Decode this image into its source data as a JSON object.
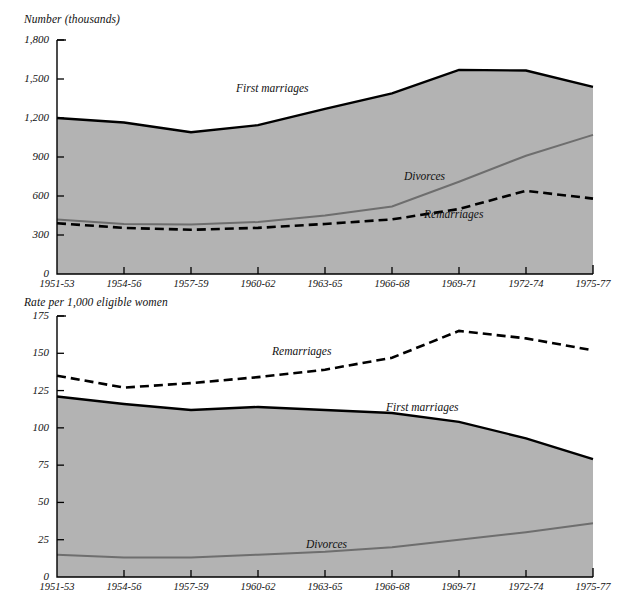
{
  "chart_data": [
    {
      "type": "area",
      "id": "marriages-divorces-number",
      "title": "Number (thousands)",
      "ylabel": "Number (thousands)",
      "xlabel": "",
      "categories": [
        "1951-53",
        "1954-56",
        "1957-59",
        "1960-62",
        "1963-65",
        "1966-68",
        "1969-71",
        "1972-74",
        "1975-77"
      ],
      "ylim": [
        0,
        1800
      ],
      "yticks": [
        0,
        300,
        600,
        900,
        1200,
        1500,
        1800
      ],
      "ytick_labels": [
        "0",
        "300",
        "600",
        "900",
        "1,200",
        "1,500",
        "1,800"
      ],
      "grid": false,
      "legend": "inline-annotations",
      "series": [
        {
          "name": "First marriages",
          "style": "solid-black-thick-filled",
          "values": [
            1200,
            1165,
            1090,
            1145,
            1270,
            1390,
            1570,
            1565,
            1440
          ]
        },
        {
          "name": "Divorces",
          "style": "solid-gray",
          "values": [
            420,
            385,
            380,
            400,
            450,
            520,
            710,
            910,
            1070
          ]
        },
        {
          "name": "Remarriages",
          "style": "dashed-black",
          "values": [
            390,
            355,
            340,
            355,
            385,
            420,
            500,
            640,
            580
          ]
        }
      ]
    },
    {
      "type": "area",
      "id": "marriages-divorces-rate",
      "title": "Rate per 1,000 eligible women",
      "ylabel": "Rate per 1,000 eligible women",
      "xlabel": "",
      "categories": [
        "1951-53",
        "1954-56",
        "1957-59",
        "1960-62",
        "1963-65",
        "1966-68",
        "1969-71",
        "1972-74",
        "1975-77"
      ],
      "ylim": [
        0,
        175
      ],
      "yticks": [
        0,
        25,
        50,
        75,
        100,
        125,
        150,
        175
      ],
      "ytick_labels": [
        "0",
        "25",
        "50",
        "75",
        "100",
        "125",
        "150",
        "175"
      ],
      "grid": false,
      "legend": "inline-annotations",
      "series": [
        {
          "name": "Remarriages",
          "style": "dashed-black",
          "values": [
            135,
            127,
            130,
            134,
            139,
            147,
            165,
            160,
            152
          ]
        },
        {
          "name": "First marriages",
          "style": "solid-black-thick-filled",
          "values": [
            121,
            116,
            112,
            114,
            112,
            110,
            104,
            93,
            79
          ]
        },
        {
          "name": "Divorces",
          "style": "solid-gray",
          "values": [
            15,
            13,
            13,
            15,
            17,
            20,
            25,
            30,
            36
          ]
        }
      ]
    }
  ],
  "top": {
    "axis_title": "Number (thousands)",
    "ytick_labels": [
      "1,800",
      "1,500",
      "1,200",
      "900",
      "600",
      "300",
      "0"
    ],
    "xtick_labels": [
      "1951-53",
      "1954-56",
      "1957-59",
      "1960-62",
      "1963-65",
      "1966-68",
      "1969-71",
      "1972-74",
      "1975-77"
    ],
    "labels": {
      "first_marriages": "First marriages",
      "divorces": "Divorces",
      "remarriages": "Remarriages"
    }
  },
  "bottom": {
    "axis_title": "Rate per 1,000 eligible women",
    "ytick_labels": [
      "175",
      "150",
      "125",
      "100",
      "75",
      "50",
      "25",
      "0"
    ],
    "xtick_labels": [
      "1951-53",
      "1954-56",
      "1957-59",
      "1960-62",
      "1963-65",
      "1966-68",
      "1969-71",
      "1972-74",
      "1975-77"
    ],
    "labels": {
      "remarriages": "Remarriages",
      "first_marriages": "First marriages",
      "divorces": "Divorces"
    }
  },
  "colors": {
    "area_fill": "#b3b3b3",
    "line_black": "#000000",
    "line_gray": "#6e6e6e",
    "text": "#111111",
    "background": "#ffffff"
  }
}
